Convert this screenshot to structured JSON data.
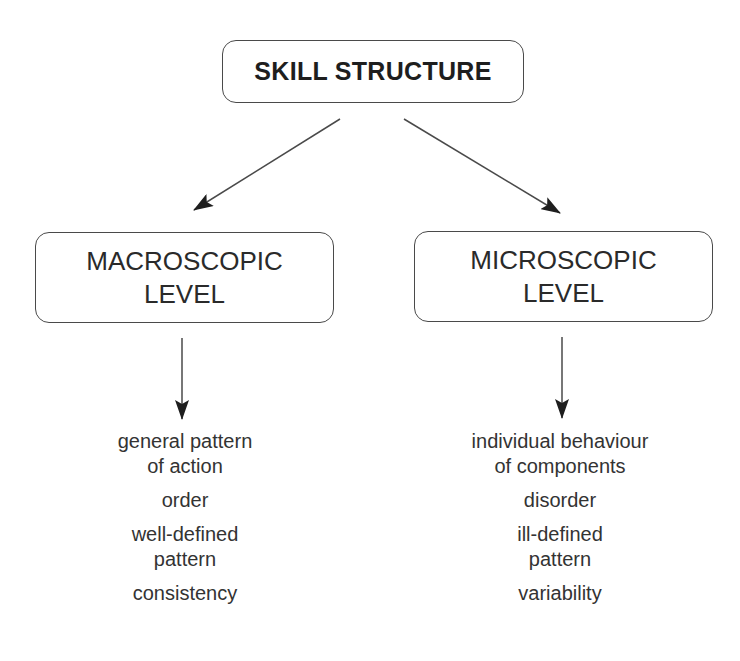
{
  "title": "SKILL STRUCTURE",
  "levels": [
    {
      "name_lines": [
        "MACROSCOPIC",
        "LEVEL"
      ],
      "characteristics": [
        [
          "general pattern",
          "of action"
        ],
        [
          "order"
        ],
        [
          "well-defined",
          "pattern"
        ],
        [
          "consistency"
        ]
      ]
    },
    {
      "name_lines": [
        "MICROSCOPIC",
        "LEVEL"
      ],
      "characteristics": [
        [
          "individual behaviour",
          "of components"
        ],
        [
          "disorder"
        ],
        [
          "ill-defined",
          "pattern"
        ],
        [
          "variability"
        ]
      ]
    }
  ],
  "colors": {
    "line": "#4a4a4a",
    "text": "#262626"
  }
}
